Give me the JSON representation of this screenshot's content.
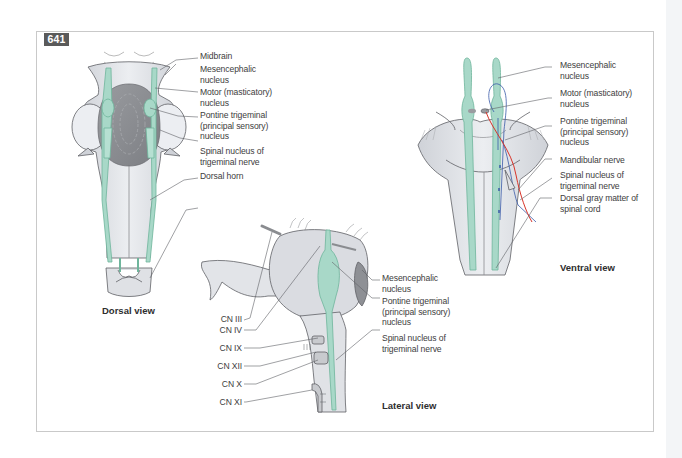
{
  "figure": {
    "number": "641",
    "colors": {
      "nucleus_green": "#a8d8c8",
      "nucleus_green_stroke": "#6fb59c",
      "tissue_gray": "#e4e6ea",
      "dark_gray": "#8a8c90",
      "outline": "#5f6166",
      "motor_fiber_red": "#d8342a",
      "sensory_fiber_blue": "#3a5aa8",
      "badge_bg": "#5a5a5a"
    }
  },
  "dorsal_view": {
    "title": "Dorsal view",
    "labels": [
      {
        "id": "midbrain",
        "text": "Midbrain"
      },
      {
        "id": "mesencephalic",
        "text": "Mesencephalic\nnucleus"
      },
      {
        "id": "motor",
        "text": "Motor (masticatory)\nnucleus"
      },
      {
        "id": "pontine",
        "text": "Pontine trigeminal\n(principal sensory)\nnucleus"
      },
      {
        "id": "spinal",
        "text": "Spinal nucleus of\ntrigeminal nerve"
      },
      {
        "id": "dorsal_horn",
        "text": "Dorsal horn"
      }
    ]
  },
  "ventral_view": {
    "title": "Ventral view",
    "labels": [
      {
        "id": "mesencephalic",
        "text": "Mesencephalic\nnucleus"
      },
      {
        "id": "motor",
        "text": "Motor (masticatory)\nnucleus"
      },
      {
        "id": "pontine",
        "text": "Pontine trigeminal\n(principal sensory)\nnucleus"
      },
      {
        "id": "mandibular",
        "text": "Mandibular nerve"
      },
      {
        "id": "spinal",
        "text": "Spinal nucleus of\ntrigeminal nerve"
      },
      {
        "id": "dorsal_gray",
        "text": "Dorsal gray matter of\nspinal cord"
      }
    ]
  },
  "lateral_view": {
    "title": "Lateral view",
    "right_labels": [
      {
        "id": "mesencephalic",
        "text": "Mesencephalic\nnucleus"
      },
      {
        "id": "pontine",
        "text": "Pontine trigeminal\n(principal sensory)\nnucleus"
      },
      {
        "id": "spinal",
        "text": "Spinal nucleus of\ntrigeminal nerve"
      }
    ],
    "left_labels": [
      {
        "id": "cn3",
        "text": "CN III"
      },
      {
        "id": "cn4",
        "text": "CN IV"
      },
      {
        "id": "cn9",
        "text": "CN IX"
      },
      {
        "id": "cn12",
        "text": "CN XII"
      },
      {
        "id": "cn10",
        "text": "CN X"
      },
      {
        "id": "cn11",
        "text": "CN XI"
      }
    ]
  }
}
